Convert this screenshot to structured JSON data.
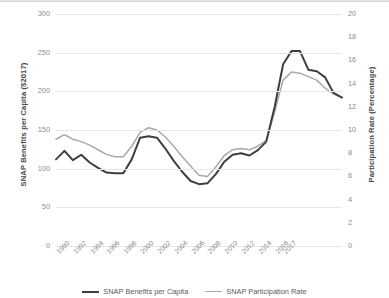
{
  "chart_data": {
    "type": "line",
    "title": "",
    "xlabel": "",
    "ylabel": "SNAP Benefits per Capita ($2017)",
    "y2label": "Participation Rate (Percentage)",
    "grid": true,
    "legend_position": "bottom",
    "x": [
      "1990",
      "1991",
      "1992",
      "1993",
      "1994",
      "1995",
      "1996",
      "1997",
      "1998",
      "1999",
      "2000",
      "2001",
      "2002",
      "2003",
      "2004",
      "2005",
      "2006",
      "2007",
      "2008",
      "2009",
      "2010",
      "2011",
      "2012",
      "2013",
      "2014",
      "2015",
      "2016",
      "2017"
    ],
    "xtick_labels": [
      "1990",
      "1992",
      "1994",
      "1996",
      "1998",
      "2000",
      "2002",
      "2004",
      "2006",
      "2008",
      "2010",
      "2012",
      "2014",
      "2016",
      "2017"
    ],
    "ylim": [
      0,
      300
    ],
    "yticks": [
      0,
      50,
      100,
      150,
      200,
      250,
      300
    ],
    "y2lim": [
      0,
      20
    ],
    "y2ticks": [
      0,
      2,
      4,
      6,
      8,
      10,
      12,
      14,
      16,
      18,
      20
    ],
    "series": [
      {
        "name": "SNAP Benefits per Capita",
        "axis": "left",
        "color": "#3f3f3f",
        "width": 2.0,
        "values": [
          112,
          123,
          111,
          118,
          108,
          101,
          95,
          94,
          94,
          112,
          140,
          142,
          140,
          126,
          110,
          96,
          84,
          80,
          81,
          93,
          109,
          118,
          120,
          117,
          124,
          135,
          180,
          235
        ]
      },
      {
        "name": "SNAP Participation Rate",
        "axis": "right",
        "color": "#a9a9a9",
        "width": 1.5,
        "values": [
          9.2,
          9.6,
          9.2,
          9.0,
          8.7,
          8.3,
          7.9,
          7.7,
          7.7,
          8.6,
          9.8,
          10.2,
          10.0,
          9.4,
          8.6,
          7.7,
          6.9,
          6.1,
          6.0,
          6.8,
          7.8,
          8.3,
          8.4,
          8.3,
          8.6,
          9.1,
          11.6,
          14.3
        ]
      }
    ],
    "series_left_full": [
      112,
      123,
      111,
      118,
      108,
      101,
      95,
      94,
      94,
      112,
      140,
      142,
      140,
      126,
      110,
      96,
      84,
      80,
      81,
      93,
      109,
      118,
      120,
      117,
      124,
      135,
      180,
      235,
      252,
      252,
      228,
      226,
      218,
      198,
      192
    ],
    "note": "values read from gridlines"
  },
  "legend": {
    "items": [
      {
        "label": "SNAP Benefits per Capita",
        "color": "#3f3f3f"
      },
      {
        "label": "SNAP Participation Rate",
        "color": "#a9a9a9"
      }
    ]
  }
}
